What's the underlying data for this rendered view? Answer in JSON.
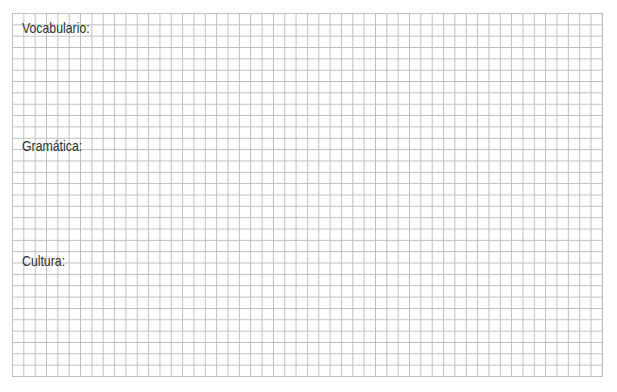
{
  "worksheet": {
    "sections": [
      {
        "label": "Vocabulario:"
      },
      {
        "label": "Gramática:"
      },
      {
        "label": "Cultura:"
      }
    ],
    "grid": {
      "line_color": "#bdbdbd",
      "columns": 52,
      "rows": 32
    }
  }
}
